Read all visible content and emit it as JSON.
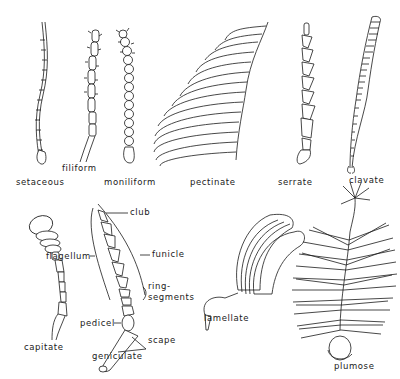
{
  "figure": {
    "antenna_types": [
      {
        "id": "setaceous",
        "label": "setaceous"
      },
      {
        "id": "filiform",
        "label": "filiform"
      },
      {
        "id": "moniliform",
        "label": "moniliform"
      },
      {
        "id": "pectinate",
        "label": "pectinate"
      },
      {
        "id": "serrate",
        "label": "serrate"
      },
      {
        "id": "clavate",
        "label": "clavate"
      },
      {
        "id": "capitate",
        "label": "capitate"
      },
      {
        "id": "geniculate",
        "label": "geniculate"
      },
      {
        "id": "lamellate",
        "label": "lamellate"
      },
      {
        "id": "plumose",
        "label": "plumose"
      }
    ],
    "geniculate_parts": {
      "club": "club",
      "funicle": "funicle",
      "flagellum": "flagellum",
      "ring_segments_1": "ring-",
      "ring_segments_2": "segments",
      "pedicel": "pedicel",
      "scape": "scape"
    },
    "colors": {
      "ink": "#1a1a1a",
      "background": "#ffffff"
    }
  }
}
